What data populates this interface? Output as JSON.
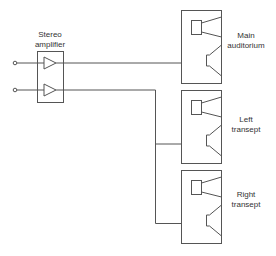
{
  "diagram": {
    "type": "audio-distribution-schematic",
    "amplifier": {
      "label_line1": "Stereo",
      "label_line2": "amplifier",
      "channels": 2
    },
    "inputs": [
      "input-1",
      "input-2"
    ],
    "speakers": [
      {
        "id": "main",
        "label_line1": "Main",
        "label_line2": "auditorium",
        "fed_by": "channel-1"
      },
      {
        "id": "left",
        "label_line1": "Left",
        "label_line2": "transept",
        "fed_by": "channel-2"
      },
      {
        "id": "right",
        "label_line1": "Right",
        "label_line2": "transept",
        "fed_by": "channel-2"
      }
    ],
    "colors": {
      "line": "#555555",
      "text": "#333333",
      "background": "#ffffff"
    }
  }
}
